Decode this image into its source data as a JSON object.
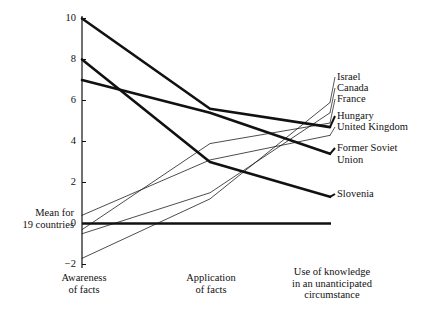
{
  "chart_data": {
    "type": "line",
    "title": "",
    "xlabel": "",
    "ylabel": "",
    "ylim": [
      -2,
      10
    ],
    "yticks": [
      10,
      8,
      6,
      4,
      2,
      0,
      -2
    ],
    "ytick_labels": [
      "10",
      "8",
      "6",
      "4",
      "2",
      "0",
      "−2"
    ],
    "grid": false,
    "legend_position": "right-inline-labels",
    "categories": [
      "Awareness\nof facts",
      "Application\nof facts",
      "Use of knowledge\nin an unanticipated\ncircumstance"
    ],
    "reference_line": {
      "value": 0,
      "label": "Mean for\n19 countries",
      "style": "bold-horizontal"
    },
    "series": [
      {
        "name": "Israel",
        "values": [
          -1.7,
          1.2,
          5.9
        ],
        "style": "thin"
      },
      {
        "name": "Canada",
        "values": [
          -0.5,
          1.5,
          5.4
        ],
        "style": "thin"
      },
      {
        "name": "France",
        "values": [
          -0.3,
          3.9,
          4.9
        ],
        "style": "thin"
      },
      {
        "name": "Hungary",
        "values": [
          10.0,
          5.6,
          4.7
        ],
        "style": "bold"
      },
      {
        "name": "United Kingdom",
        "values": [
          0.4,
          3.1,
          4.3
        ],
        "style": "thin"
      },
      {
        "name": "Former Soviet Union",
        "values": [
          7.0,
          5.4,
          3.4
        ],
        "style": "bold"
      },
      {
        "name": "Slovenia",
        "values": [
          8.0,
          3.0,
          1.3
        ],
        "style": "bold"
      }
    ],
    "right_labels": [
      {
        "text": "Israel"
      },
      {
        "text": "Canada"
      },
      {
        "text": "France"
      },
      {
        "text": "Hungary"
      },
      {
        "text": "United Kingdom"
      },
      {
        "text": "Former Soviet\nUnion"
      },
      {
        "text": "Slovenia"
      }
    ],
    "colors": {
      "line": "#111111",
      "axis": "#111111",
      "text": "#111111",
      "background": "#ffffff"
    }
  }
}
